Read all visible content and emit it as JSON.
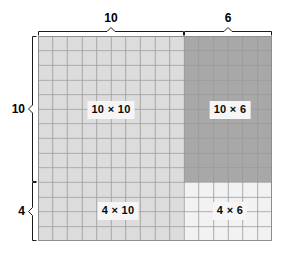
{
  "figure": {
    "grid": {
      "columns": 16,
      "rows": 14,
      "cell_size_px": 14.6,
      "line_color": "#9a9a9a",
      "outline_color": "#8e8e8e"
    },
    "split": {
      "column_split": 10,
      "row_split": 10
    },
    "quadrants": [
      {
        "id": "top-left",
        "label": "10 × 10",
        "cols": 10,
        "rows": 10,
        "fill": "#dcdcdc",
        "product": 100
      },
      {
        "id": "top-right",
        "label": "10 × 6",
        "cols": 6,
        "rows": 10,
        "fill": "#a8a8a8",
        "product": 60
      },
      {
        "id": "bottom-left",
        "label": "4 × 10",
        "cols": 10,
        "rows": 4,
        "fill": "#dcdcdc",
        "product": 40
      },
      {
        "id": "bottom-right",
        "label": "4 × 6",
        "cols": 6,
        "rows": 4,
        "fill": "#f2f2f2",
        "product": 24
      }
    ],
    "dimensions": {
      "top": [
        {
          "id": "top-10",
          "value": "10",
          "span_cols": 10
        },
        {
          "id": "top-6",
          "value": "6",
          "span_cols": 6
        }
      ],
      "left": [
        {
          "id": "left-10",
          "value": "10",
          "span_rows": 10
        },
        {
          "id": "left-4",
          "value": "4",
          "span_rows": 4
        }
      ]
    }
  },
  "chart_data": {
    "type": "table",
    "xlabel": "",
    "ylabel": "",
    "categories": [
      "10 × 10",
      "10 × 6",
      "4 × 10",
      "4 × 6"
    ],
    "values": [
      100,
      60,
      40,
      24
    ],
    "grid": true,
    "legend": "none"
  }
}
